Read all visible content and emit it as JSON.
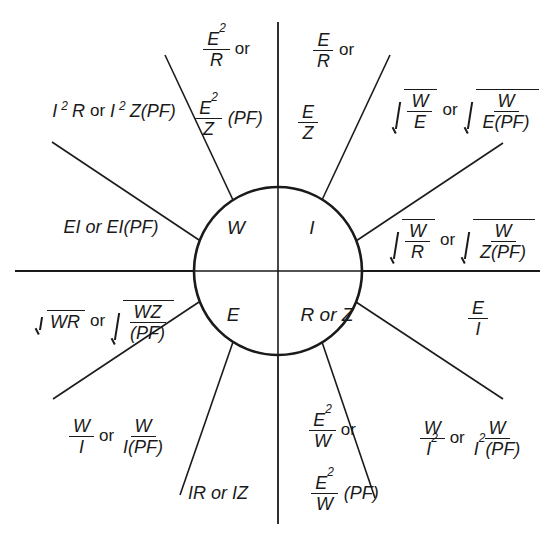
{
  "diagram": {
    "stroke_color": "#1a1a1a",
    "background": "#ffffff"
  },
  "core": {
    "power": "W",
    "current": "I",
    "voltage": "E",
    "resistance": "R or Z"
  },
  "geometry": {
    "circle_cx": 278,
    "circle_cy": 271,
    "circle_r": 84,
    "h_axis_x1": 15,
    "h_axis_x2": 540,
    "h_axis_y": 271,
    "v_axis_y1": 22,
    "v_axis_y2": 524,
    "v_axis_x": 278
  },
  "sectors": {
    "power": {
      "quadrant_label": "W",
      "formulas": [
        {
          "id": "i2r",
          "parts": [
            "I",
            "2",
            "R or ",
            "I",
            "2",
            "Z(PF)"
          ],
          "text": "I²R or I²Z(PF)"
        },
        {
          "id": "e2r",
          "num": "E",
          "num_sup": "2",
          "den": "R",
          "text": "E²/R"
        },
        {
          "id": "e2z_pf",
          "num": "E",
          "num_sup": "2",
          "den": "Z",
          "suffix": "(PF)",
          "text": "E²/Z (PF)"
        },
        {
          "id": "ei",
          "text": "EI or EI(PF)"
        }
      ],
      "or_label": "or"
    },
    "current": {
      "quadrant_label": "I",
      "formulas": [
        {
          "id": "e_over_r",
          "num": "E",
          "den": "R",
          "text": "E/R"
        },
        {
          "id": "e_over_z",
          "num": "E",
          "den": "Z",
          "text": "E/Z"
        },
        {
          "id": "sqrt_w_over_e",
          "num": "W",
          "den": "E",
          "text": "√(W/E)"
        },
        {
          "id": "sqrt_w_over_e_pf",
          "num": "W",
          "den": "E(PF)",
          "text": "√(W/E(PF))"
        },
        {
          "id": "sqrt_w_over_r",
          "num": "W",
          "den": "R",
          "text": "√(W/R)"
        },
        {
          "id": "sqrt_w_over_z_pf",
          "num": "W",
          "den": "Z(PF)",
          "text": "√(W/Z(PF))"
        }
      ],
      "or_label": "or"
    },
    "voltage": {
      "quadrant_label": "E",
      "formulas": [
        {
          "id": "sqrt_wr",
          "text": "√WR"
        },
        {
          "id": "sqrt_wz_pf",
          "num": "WZ",
          "den": "(PF)",
          "text": "√(WZ/(PF))"
        },
        {
          "id": "w_over_i",
          "num": "W",
          "den": "I",
          "text": "W/I"
        },
        {
          "id": "w_over_i_pf",
          "num": "W",
          "den": "I(PF)",
          "text": "W/I(PF)"
        },
        {
          "id": "ir_or_iz",
          "text": "IR or IZ"
        }
      ],
      "or_label": "or"
    },
    "resistance": {
      "quadrant_label": "R or Z",
      "formulas": [
        {
          "id": "e_over_i",
          "num": "E",
          "den": "I",
          "text": "E/I"
        },
        {
          "id": "w_over_i2",
          "num": "W",
          "den": "I",
          "den_sup": "2",
          "text": "W/I²"
        },
        {
          "id": "w_over_i2_pf",
          "num": "W",
          "den": "I²(PF)",
          "text": "W/I²(PF)"
        },
        {
          "id": "e2_over_w",
          "num": "E",
          "num_sup": "2",
          "den": "W",
          "text": "E²/W"
        },
        {
          "id": "e2_over_w_pf",
          "num": "E",
          "num_sup": "2",
          "den": "W",
          "suffix": "(PF)",
          "text": "E²/W (PF)"
        }
      ],
      "or_label": "or"
    }
  },
  "labels": {
    "or": "or",
    "pf": "(PF)",
    "E": "E",
    "I": "I",
    "R": "R",
    "Z": "Z",
    "W": "W",
    "two": "2",
    "i2r_text": "I",
    "r_or": "R or ",
    "z_pf": "Z(PF)",
    "ei_text": "EI or EI(PF)",
    "ir_iz_text": "IR or IZ",
    "sqrt_wr_text": "WR",
    "wz": "WZ",
    "pf_paren": "(PF)",
    "e_pf": "E(PF)",
    "z_pf_plain": "Z(PF)",
    "i_pf": "I(PF)",
    "r_or_z": "R or Z"
  }
}
